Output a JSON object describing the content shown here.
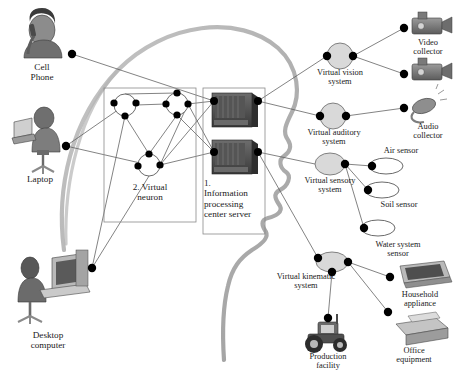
{
  "diagram": {
    "background_color": "#ffffff",
    "outline_color": "#9a9a9a",
    "node_fill": "#d9d9d9",
    "dot_color": "#000000",
    "line_color": "#555555",
    "boxes": [
      {
        "id": "neuron_box",
        "label": "2. Virtual\nneuron",
        "x": 104,
        "y": 88,
        "w": 92,
        "h": 134
      },
      {
        "id": "server_box",
        "label": "1.\nInformation\nprocessing\ncenter server",
        "x": 203,
        "y": 88,
        "w": 62,
        "h": 146
      }
    ],
    "left_clients": [
      {
        "id": "cell_phone",
        "label": "Cell\nPhone",
        "icon": "person-with-phone-icon",
        "lx": 18,
        "ly": 60,
        "ix": 12,
        "iy": 12,
        "iw": 62,
        "ih": 48
      },
      {
        "id": "laptop",
        "label": "Laptop",
        "icon": "person-with-laptop-icon",
        "lx": 14,
        "ly": 172,
        "ix": 8,
        "iy": 104,
        "iw": 70,
        "ih": 66
      },
      {
        "id": "desktop_computer",
        "label": "Desktop\ncomputer",
        "icon": "person-at-desktop-icon",
        "lx": 16,
        "ly": 330,
        "ix": 6,
        "iy": 254,
        "iw": 82,
        "ih": 74
      }
    ],
    "virtual_systems": [
      {
        "id": "virtual_vision",
        "label": "Virtual vision\nsystem",
        "cx": 340,
        "cy": 56,
        "rx": 13,
        "ry": 13,
        "lx": 298,
        "ly": 68,
        "lw": 86
      },
      {
        "id": "virtual_auditory",
        "label": "Virtual auditory\nsystem",
        "cx": 333,
        "cy": 116,
        "rx": 13,
        "ry": 13,
        "lx": 290,
        "ly": 128,
        "lw": 90
      },
      {
        "id": "virtual_sensory",
        "label": "Virtual sensory\nsystem",
        "cx": 330,
        "cy": 164,
        "rx": 15,
        "ry": 11,
        "lx": 286,
        "ly": 175,
        "lw": 90
      },
      {
        "id": "virtual_kinematic",
        "label": "Virtual kinematic\nsystem",
        "cx": 332,
        "cy": 262,
        "rx": 16,
        "ry": 10,
        "lx": 258,
        "ly": 272,
        "lw": 96
      }
    ],
    "peripherals": [
      {
        "id": "video_collector_1",
        "label": "Video\ncollector",
        "icon": "video-camera-icon",
        "lx": 398,
        "ly": 40,
        "lw": 56,
        "ix": 404,
        "iy": 18,
        "iw": 50,
        "ih": 26,
        "dx": 404,
        "dy": 28
      },
      {
        "id": "video_collector_2",
        "label": "",
        "icon": "video-camera-icon",
        "ix": 404,
        "iy": 64,
        "iw": 50,
        "ih": 26,
        "dx": 404,
        "dy": 74
      },
      {
        "id": "audio_collector",
        "label": "Audio\ncollector",
        "icon": "headset-microphone-icon",
        "lx": 398,
        "ly": 122,
        "lw": 56,
        "ix": 404,
        "iy": 96,
        "iw": 48,
        "ih": 26,
        "dx": 404,
        "dy": 108
      },
      {
        "id": "air_sensor",
        "label": "Air sensor",
        "icon": "sensor-ellipse-icon",
        "lx": 370,
        "ly": 146,
        "lw": 62,
        "ex": 386,
        "ey": 166,
        "erx": 17,
        "ery": 8,
        "dx": 372,
        "dy": 166
      },
      {
        "id": "soil_sensor",
        "label": "Soil sensor",
        "icon": "sensor-ellipse-icon",
        "lx": 370,
        "ly": 203,
        "lw": 62,
        "ex": 382,
        "ey": 190,
        "erx": 17,
        "ery": 8,
        "dx": 368,
        "dy": 190
      },
      {
        "id": "water_sensor",
        "label": "Water system\nsensor",
        "icon": "sensor-ellipse-icon",
        "lx": 364,
        "ly": 242,
        "lw": 72,
        "ex": 378,
        "ey": 228,
        "erx": 17,
        "ery": 8,
        "dx": 364,
        "dy": 228
      },
      {
        "id": "household_appliance",
        "label": "Household\nappliance",
        "icon": "television-icon",
        "lx": 384,
        "ly": 291,
        "lw": 72,
        "ix": 392,
        "iy": 261,
        "iw": 56,
        "ih": 30,
        "dx": 390,
        "dy": 277
      },
      {
        "id": "office_equipment",
        "label": "Office\nequipment",
        "icon": "printer-icon",
        "lx": 382,
        "ly": 347,
        "lw": 64,
        "ix": 390,
        "iy": 316,
        "iw": 52,
        "ih": 30,
        "dx": 388,
        "dy": 312
      },
      {
        "id": "production_facility",
        "label": "Production\nfacility",
        "icon": "tractor-icon",
        "lx": 294,
        "ly": 352,
        "lw": 72,
        "ix": 300,
        "iy": 316,
        "iw": 58,
        "ih": 38,
        "dx": 328,
        "dy": 318
      }
    ],
    "neuron_nodes": [
      {
        "id": "neuron_1",
        "cx": 125,
        "cy": 105,
        "r": 11
      },
      {
        "id": "neuron_2",
        "cx": 177,
        "cy": 104,
        "r": 11
      },
      {
        "id": "neuron_3",
        "cx": 149,
        "cy": 165,
        "r": 11
      }
    ],
    "server_nodes": [
      {
        "id": "server_upper",
        "x": 210,
        "y": 93,
        "w": 48,
        "h": 38
      },
      {
        "id": "server_lower",
        "x": 210,
        "y": 140,
        "w": 48,
        "h": 38
      }
    ]
  }
}
